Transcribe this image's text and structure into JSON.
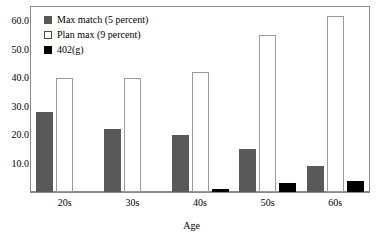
{
  "chart_data": {
    "type": "bar",
    "title": "",
    "xlabel": "Age",
    "ylabel": "",
    "categories": [
      "20s",
      "30s",
      "40s",
      "50s",
      "60s"
    ],
    "series": [
      {
        "name": "Max match (5 percent)",
        "color": "#595959",
        "values": [
          28,
          22,
          20,
          15,
          9
        ]
      },
      {
        "name": "Plan max (9 percent)",
        "color": "#ffffff",
        "values": [
          40,
          40,
          42,
          55,
          62
        ]
      },
      {
        "name": "402(g)",
        "color": "#000000",
        "values": [
          0,
          0,
          1,
          3,
          4
        ]
      }
    ],
    "ylim": [
      0,
      65
    ],
    "yticks": [
      10,
      20,
      30,
      40,
      50,
      60
    ],
    "ytick_labels": [
      "10.0",
      "20.0",
      "30.0",
      "40.0",
      "50.0",
      "60.0"
    ],
    "grid": false,
    "legend_position": "top-left",
    "frame": true
  },
  "legend": {
    "entries": [
      {
        "label": "Max match (5 percent)",
        "swatch": "gray-square-icon"
      },
      {
        "label": "Plan max (9 percent)",
        "swatch": "white-square-icon"
      },
      {
        "label": "402(g)",
        "swatch": "black-square-icon"
      }
    ]
  },
  "axes": {
    "x_title": "Age"
  }
}
